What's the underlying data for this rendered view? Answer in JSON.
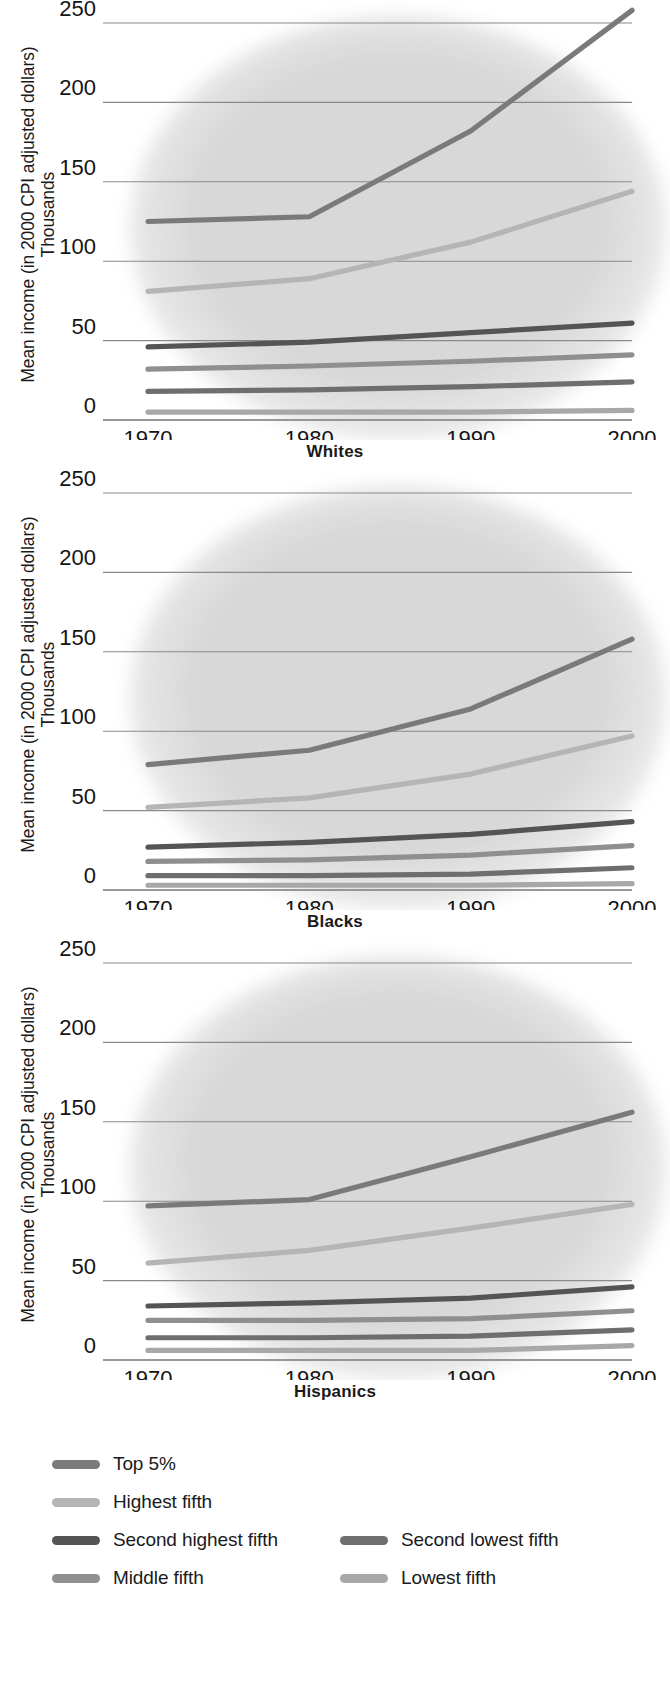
{
  "figure": {
    "y_axis_label_line1": "Mean income (in 2000 CPI adjusted dollars)",
    "y_axis_label_line2": "Thousands"
  },
  "panels": [
    {
      "title": "Whites"
    },
    {
      "title": "Blacks"
    },
    {
      "title": "Hispanics"
    }
  ],
  "legend": {
    "items": [
      {
        "label": "Top 5%",
        "color": "#7a7a7a"
      },
      {
        "label": "Highest fifth",
        "color": "#b5b5b5"
      },
      {
        "label": "Second highest fifth",
        "color": "#545454"
      },
      {
        "label": "Second lowest fifth",
        "color": "#6e6e6e"
      },
      {
        "label": "Middle fifth",
        "color": "#8f8f8f"
      },
      {
        "label": "Lowest fifth",
        "color": "#a8a8a8"
      }
    ]
  },
  "chart_data": [
    {
      "type": "line",
      "title": "Whites",
      "xlabel": "",
      "ylabel": "Mean income (in 2000 CPI adjusted dollars) Thousands",
      "x": [
        1970,
        1980,
        1990,
        2000
      ],
      "xticklabels": [
        "1970",
        "1980",
        "1990",
        "2000"
      ],
      "yticks": [
        0,
        50,
        100,
        150,
        200,
        250
      ],
      "ylim": [
        0,
        250
      ],
      "grid": true,
      "legend_position": "below-figure",
      "series": [
        {
          "name": "Top 5%",
          "color": "#7a7a7a",
          "values": [
            125,
            128,
            182,
            258
          ]
        },
        {
          "name": "Highest fifth",
          "color": "#b5b5b5",
          "values": [
            81,
            89,
            112,
            144
          ]
        },
        {
          "name": "Second highest fifth",
          "color": "#545454",
          "values": [
            46,
            49,
            55,
            61
          ]
        },
        {
          "name": "Middle fifth",
          "color": "#8f8f8f",
          "values": [
            32,
            34,
            37,
            41
          ]
        },
        {
          "name": "Second lowest fifth",
          "color": "#6e6e6e",
          "values": [
            18,
            19,
            21,
            24
          ]
        },
        {
          "name": "Lowest fifth",
          "color": "#a8a8a8",
          "values": [
            5,
            5,
            5,
            6
          ]
        }
      ]
    },
    {
      "type": "line",
      "title": "Blacks",
      "xlabel": "",
      "ylabel": "Mean income (in 2000 CPI adjusted dollars) Thousands",
      "x": [
        1970,
        1980,
        1990,
        2000
      ],
      "xticklabels": [
        "1970",
        "1980",
        "1990",
        "2000"
      ],
      "yticks": [
        0,
        50,
        100,
        150,
        200,
        250
      ],
      "ylim": [
        0,
        250
      ],
      "grid": true,
      "legend_position": "below-figure",
      "series": [
        {
          "name": "Top 5%",
          "color": "#7a7a7a",
          "values": [
            79,
            88,
            114,
            158
          ]
        },
        {
          "name": "Highest fifth",
          "color": "#b5b5b5",
          "values": [
            52,
            58,
            73,
            97
          ]
        },
        {
          "name": "Second highest fifth",
          "color": "#545454",
          "values": [
            27,
            30,
            35,
            43
          ]
        },
        {
          "name": "Middle fifth",
          "color": "#8f8f8f",
          "values": [
            18,
            19,
            22,
            28
          ]
        },
        {
          "name": "Second lowest fifth",
          "color": "#6e6e6e",
          "values": [
            9,
            9,
            10,
            14
          ]
        },
        {
          "name": "Lowest fifth",
          "color": "#a8a8a8",
          "values": [
            3,
            3,
            3,
            4
          ]
        }
      ]
    },
    {
      "type": "line",
      "title": "Hispanics",
      "xlabel": "",
      "ylabel": "Mean income (in 2000 CPI adjusted dollars) Thousands",
      "x": [
        1970,
        1980,
        1990,
        2000
      ],
      "xticklabels": [
        "1970",
        "1980",
        "1990",
        "2000"
      ],
      "yticks": [
        0,
        50,
        100,
        150,
        200,
        250
      ],
      "ylim": [
        0,
        250
      ],
      "grid": true,
      "legend_position": "below-figure",
      "series": [
        {
          "name": "Top 5%",
          "color": "#7a7a7a",
          "values": [
            97,
            101,
            128,
            156
          ]
        },
        {
          "name": "Highest fifth",
          "color": "#b5b5b5",
          "values": [
            61,
            69,
            83,
            98
          ]
        },
        {
          "name": "Second highest fifth",
          "color": "#545454",
          "values": [
            34,
            36,
            39,
            46
          ]
        },
        {
          "name": "Middle fifth",
          "color": "#8f8f8f",
          "values": [
            25,
            25,
            26,
            31
          ]
        },
        {
          "name": "Second lowest fifth",
          "color": "#6e6e6e",
          "values": [
            14,
            14,
            15,
            19
          ]
        },
        {
          "name": "Lowest fifth",
          "color": "#a8a8a8",
          "values": [
            6,
            6,
            6,
            9
          ]
        }
      ]
    }
  ]
}
